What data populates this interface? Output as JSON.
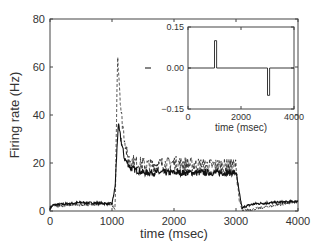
{
  "chart_data": [
    {
      "type": "line",
      "title": "",
      "xlabel": "time (msec)",
      "ylabel": "Firing rate (Hz)",
      "xlim": [
        0,
        4000
      ],
      "ylim": [
        0,
        80
      ],
      "xticks": [
        0,
        1000,
        2000,
        3000,
        4000
      ],
      "yticks": [
        0,
        20,
        40,
        60,
        80
      ],
      "xtick_labels": [
        "0",
        "1000",
        "2000",
        "3000",
        "4000"
      ],
      "ytick_labels": [
        "0",
        "20",
        "40",
        "60",
        "80"
      ],
      "grid": false,
      "series": [
        {
          "name": "solid",
          "style": "solid",
          "x": [
            0,
            50,
            500,
            1000,
            1050,
            1100,
            1200,
            1300,
            1500,
            2000,
            2500,
            3000,
            3050,
            3100,
            3150,
            3300,
            3600,
            4000
          ],
          "values": [
            1,
            2.5,
            3.5,
            3,
            10,
            36,
            22,
            18,
            16,
            16,
            16,
            16,
            8,
            1,
            2,
            3,
            3.5,
            4
          ]
        },
        {
          "name": "dashed",
          "style": "dashed",
          "x": [
            0,
            1000,
            1050,
            1090,
            1150,
            1250,
            1400,
            1600,
            2000,
            2500,
            3000,
            3050,
            3100,
            4000
          ],
          "values": [
            2,
            3,
            0,
            66,
            40,
            22,
            20,
            19,
            20,
            19,
            19,
            5,
            0,
            4
          ]
        }
      ]
    },
    {
      "type": "line",
      "title": "",
      "xlabel": "time (msec)",
      "ylabel": "",
      "xlim": [
        0,
        4000
      ],
      "ylim": [
        -0.15,
        0.15
      ],
      "xticks": [
        0,
        2000,
        4000
      ],
      "yticks": [
        -0.15,
        0.0,
        0.15
      ],
      "xtick_labels": [
        "0",
        "2000",
        "4000"
      ],
      "ytick_labels": [
        "−0.15",
        "0.00",
        "0.15"
      ],
      "grid": false,
      "series": [
        {
          "name": "input",
          "style": "solid",
          "x": [
            0,
            1000,
            1000,
            1080,
            1080,
            3000,
            3000,
            3080,
            3080,
            4000
          ],
          "values": [
            0,
            0,
            0.1,
            0.1,
            0,
            0,
            -0.1,
            -0.1,
            0,
            0
          ]
        }
      ]
    }
  ]
}
